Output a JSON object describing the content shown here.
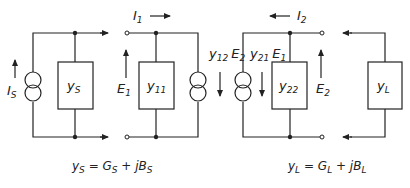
{
  "diagram": {
    "type": "two-port network admittance (y-parameter) equivalent circuit",
    "source": {
      "current": "I",
      "current_sub": "S",
      "admittance": "y",
      "admittance_sub": "S"
    },
    "two_port": {
      "input_current": "I",
      "input_current_sub": "1",
      "input_voltage": "E",
      "input_voltage_sub": "1",
      "y11": "y",
      "y11_sub": "11",
      "y12_source": "y",
      "y12_sub": "12",
      "y12_ctrl": "E",
      "y12_ctrl_sub": "2",
      "y21_source": "y",
      "y21_sub": "21",
      "y21_ctrl": "E",
      "y21_ctrl_sub": "1",
      "y22": "y",
      "y22_sub": "22",
      "output_current": "I",
      "output_current_sub": "2",
      "output_voltage": "E",
      "output_voltage_sub": "2"
    },
    "load": {
      "admittance": "y",
      "admittance_sub": "L"
    },
    "equations": {
      "source_lhs": "y",
      "source_lhs_sub": "S",
      "source_eq": " = ",
      "source_g": "G",
      "source_g_sub": "S",
      "source_plus": " + j",
      "source_b": "B",
      "source_b_sub": "S",
      "load_lhs": "y",
      "load_lhs_sub": "L",
      "load_eq": " = ",
      "load_g": "G",
      "load_g_sub": "L",
      "load_plus": " + j",
      "load_b": "B",
      "load_b_sub": "L"
    }
  }
}
